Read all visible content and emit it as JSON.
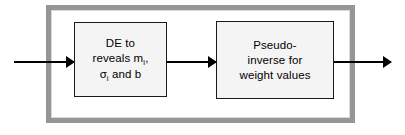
{
  "diagram": {
    "type": "block-flow",
    "colors": {
      "outer_frame": "#969696",
      "box_border": "#1a1a1a",
      "box_fill": "#f4f4f4",
      "arrow": "#000000",
      "background": "#ffffff"
    },
    "outer_container": {
      "label": "training-process-container",
      "border_style": "thick-gray-rectangle"
    },
    "blocks": [
      {
        "id": "de-block",
        "lines": [
          "DE to",
          "reveals m",
          "and b"
        ],
        "line1": "DE to",
        "line2_prefix": "reveals m",
        "line2_subscript": "i",
        "line2_suffix": ",",
        "line3_symbol": "σ",
        "line3_subscript": "i",
        "line3_suffix": " and b"
      },
      {
        "id": "pseudo-inverse-block",
        "lines": [
          "Pseudo-",
          "inverse for",
          "weight values"
        ],
        "line1": "Pseudo-",
        "line2": "inverse for",
        "line3": "weight values"
      }
    ],
    "arrows": [
      {
        "id": "input-arrow",
        "label": "",
        "direction": "right"
      },
      {
        "id": "between-blocks-arrow",
        "label": "",
        "direction": "right"
      },
      {
        "id": "output-arrow",
        "label": "",
        "direction": "right"
      }
    ]
  }
}
